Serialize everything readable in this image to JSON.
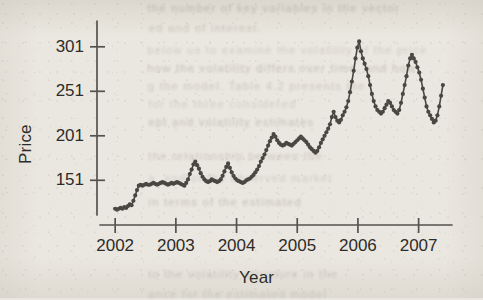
{
  "page": {
    "background_color": "#eae7e0",
    "ink_color": "#4a4743",
    "text_color": "#2e2c29"
  },
  "ghost_text": {
    "note": "faint bleed-through text from reverse of scanned page",
    "lines": [
      {
        "text": "the number of key variables in the vector",
        "x": 150,
        "y": 2
      },
      {
        "text": "ed and of interest.",
        "x": 150,
        "y": 22
      },
      {
        "text": "below us to examine the volatility of the price",
        "x": 150,
        "y": 44
      },
      {
        "text": "how the volatility differs over time, and how",
        "x": 150,
        "y": 62
      },
      {
        "text": "g the model. Table 4.2 presents the",
        "x": 150,
        "y": 80
      },
      {
        "text": "for the three considered",
        "x": 150,
        "y": 98
      },
      {
        "text": "ept and volatility estimates",
        "x": 150,
        "y": 116
      },
      {
        "text": "the relationship between the",
        "x": 150,
        "y": 150
      },
      {
        "text": "a. and of the observed market",
        "x": 150,
        "y": 172
      },
      {
        "text": "in terms of the estimated",
        "x": 150,
        "y": 196
      },
      {
        "text": "to the volatility structure in the",
        "x": 150,
        "y": 268
      },
      {
        "text": "ance for the estimated model",
        "x": 150,
        "y": 288
      }
    ]
  },
  "axes": {
    "y_label": "Price",
    "x_label": "Year",
    "y_ticks": [
      151,
      201,
      251,
      301
    ],
    "y_tick_labels": [
      "151",
      "201",
      "251",
      "301"
    ],
    "x_ticks": [
      2002,
      2003,
      2004,
      2005,
      2006,
      2007
    ],
    "x_tick_labels": [
      "2002",
      "2003",
      "2004",
      "2005",
      "2006",
      "2007"
    ],
    "x_range": [
      2001.75,
      2007.55
    ],
    "y_range": [
      112,
      330
    ],
    "grid": false,
    "axis_line_color": "#55514c"
  },
  "chart_data": {
    "type": "line",
    "title": "",
    "subtitle": "",
    "xlabel": "Year",
    "ylabel": "Price",
    "xlim": [
      2001.75,
      2007.55
    ],
    "ylim": [
      112,
      330
    ],
    "grid": false,
    "legend": "none",
    "marker": "circle",
    "marker_size": 2.1,
    "line_width": 1.6,
    "color": "#4a4743",
    "x": [
      2002.0,
      2002.03,
      2002.06,
      2002.09,
      2002.12,
      2002.15,
      2002.18,
      2002.21,
      2002.24,
      2002.27,
      2002.3,
      2002.33,
      2002.36,
      2002.39,
      2002.42,
      2002.45,
      2002.48,
      2002.51,
      2002.54,
      2002.57,
      2002.6,
      2002.63,
      2002.66,
      2002.69,
      2002.72,
      2002.75,
      2002.78,
      2002.81,
      2002.84,
      2002.87,
      2002.9,
      2002.93,
      2002.96,
      2002.99,
      2003.02,
      2003.05,
      2003.08,
      2003.11,
      2003.14,
      2003.17,
      2003.2,
      2003.23,
      2003.26,
      2003.29,
      2003.32,
      2003.35,
      2003.38,
      2003.41,
      2003.44,
      2003.47,
      2003.5,
      2003.53,
      2003.56,
      2003.59,
      2003.62,
      2003.65,
      2003.68,
      2003.71,
      2003.74,
      2003.77,
      2003.8,
      2003.83,
      2003.86,
      2003.89,
      2003.92,
      2003.95,
      2003.98,
      2004.01,
      2004.04,
      2004.07,
      2004.1,
      2004.13,
      2004.16,
      2004.19,
      2004.22,
      2004.25,
      2004.28,
      2004.31,
      2004.34,
      2004.37,
      2004.4,
      2004.43,
      2004.46,
      2004.49,
      2004.52,
      2004.55,
      2004.58,
      2004.61,
      2004.64,
      2004.67,
      2004.7,
      2004.73,
      2004.76,
      2004.79,
      2004.82,
      2004.85,
      2004.88,
      2004.91,
      2004.94,
      2004.97,
      2005.0,
      2005.03,
      2005.06,
      2005.09,
      2005.12,
      2005.15,
      2005.18,
      2005.21,
      2005.24,
      2005.27,
      2005.3,
      2005.33,
      2005.36,
      2005.39,
      2005.42,
      2005.45,
      2005.48,
      2005.51,
      2005.54,
      2005.57,
      2005.6,
      2005.63,
      2005.66,
      2005.69,
      2005.72,
      2005.75,
      2005.78,
      2005.81,
      2005.84,
      2005.87,
      2005.9,
      2005.93,
      2005.96,
      2005.99,
      2006.02,
      2006.05,
      2006.08,
      2006.11,
      2006.14,
      2006.17,
      2006.2,
      2006.23,
      2006.26,
      2006.29,
      2006.32,
      2006.35,
      2006.38,
      2006.41,
      2006.44,
      2006.47,
      2006.5,
      2006.53,
      2006.56,
      2006.59,
      2006.62,
      2006.65,
      2006.68,
      2006.71,
      2006.74,
      2006.77,
      2006.8,
      2006.83,
      2006.86,
      2006.89,
      2006.92,
      2006.95,
      2006.98,
      2007.01,
      2007.04,
      2007.07,
      2007.1,
      2007.13,
      2007.16,
      2007.19,
      2007.22,
      2007.25,
      2007.28,
      2007.31,
      2007.34,
      2007.37,
      2007.4
    ],
    "y": [
      119,
      118,
      119,
      120,
      119,
      121,
      120,
      122,
      124,
      123,
      128,
      134,
      140,
      145,
      146,
      145,
      146,
      147,
      146,
      146,
      147,
      148,
      147,
      146,
      147,
      148,
      149,
      148,
      147,
      146,
      147,
      148,
      147,
      148,
      149,
      148,
      147,
      146,
      145,
      148,
      152,
      158,
      163,
      169,
      172,
      168,
      164,
      159,
      155,
      152,
      150,
      149,
      150,
      152,
      151,
      150,
      149,
      150,
      152,
      156,
      161,
      166,
      170,
      165,
      160,
      156,
      153,
      151,
      150,
      149,
      148,
      149,
      151,
      152,
      153,
      155,
      157,
      160,
      163,
      167,
      172,
      176,
      180,
      185,
      190,
      195,
      199,
      203,
      200,
      196,
      193,
      191,
      190,
      191,
      193,
      192,
      191,
      190,
      192,
      194,
      196,
      198,
      200,
      198,
      196,
      194,
      191,
      188,
      186,
      184,
      182,
      184,
      188,
      193,
      197,
      201,
      205,
      209,
      214,
      222,
      228,
      222,
      218,
      216,
      219,
      224,
      228,
      233,
      240,
      250,
      262,
      274,
      288,
      300,
      307,
      296,
      288,
      282,
      276,
      268,
      258,
      248,
      240,
      234,
      230,
      228,
      226,
      228,
      232,
      236,
      240,
      238,
      234,
      230,
      228,
      226,
      230,
      238,
      248,
      258,
      268,
      280,
      288,
      292,
      288,
      284,
      278,
      272,
      264,
      254,
      244,
      234,
      228,
      224,
      220,
      216,
      218,
      224,
      234,
      246,
      258
    ],
    "annotations": [],
    "series_note": "single unnamed price series, roughly monthly observations 2002-01 to 2007-05"
  }
}
